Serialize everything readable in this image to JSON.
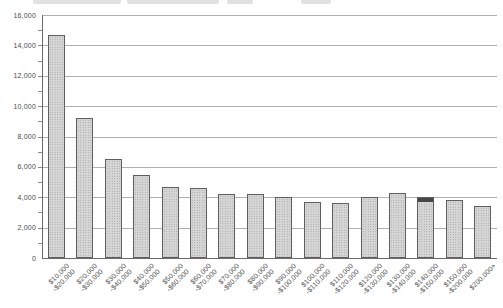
{
  "chart_data": {
    "type": "bar",
    "title": "",
    "xlabel": "",
    "ylabel": "",
    "legend": "none",
    "grid": "horizontal",
    "ylim": [
      0,
      16000
    ],
    "ytick_step": 2000,
    "y_minor_tick_step": 1000,
    "ytick_labels": [
      "16,000",
      "14,000",
      "12,000",
      "10,000",
      "8,000",
      "6,000",
      "4,000",
      "2,000",
      "0"
    ],
    "categories": [
      "$10,000-$20,000",
      "$20,000-$30,000",
      "$30,000-$40,000",
      "$40,000-$50,000",
      "$50,000-$60,000",
      "$60,000-$70,000",
      "$70,000-$80,000",
      "$80,000-$90,000",
      "$90,000-$100,000",
      "$100,000-$110,000",
      "$110,000-$120,000",
      "$120,000-$130,000",
      "$130,000-$140,000",
      "$140,000-$150,000",
      "$150,000-$200,000",
      "$200,000+"
    ],
    "category_label_lines": [
      [
        "$10,000",
        "-$20,000"
      ],
      [
        "$20,000",
        "-$30,000"
      ],
      [
        "$30,000",
        "-$40,000"
      ],
      [
        "$40,000",
        "-$50,000"
      ],
      [
        "$50,000",
        "-$60,000"
      ],
      [
        "$60,000",
        "-$70,000"
      ],
      [
        "$70,000",
        "-$80,000"
      ],
      [
        "$80,000",
        "-$90,000"
      ],
      [
        "$90,000",
        "-$100,000"
      ],
      [
        "$100,000",
        "-$110,000"
      ],
      [
        "$110,000",
        "-$120,000"
      ],
      [
        "$120,000",
        "-$130,000"
      ],
      [
        "$130,000",
        "-$140,000"
      ],
      [
        "$140,000",
        "-$150,000"
      ],
      [
        "$150,000",
        "-$200,000"
      ],
      [
        "$200,000+"
      ]
    ],
    "values": [
      14700,
      9200,
      6500,
      5500,
      4700,
      4600,
      4250,
      4250,
      4000,
      3700,
      3600,
      4050,
      4300,
      4000,
      3800,
      3450
    ],
    "highlight": {
      "category": "$140,000-$150,000",
      "style": "dark-cap-on-bar-top",
      "cap_color": "#474747"
    },
    "colors": {
      "bar_fill": "#d6d6d6",
      "bar_dot_texture": "#979797",
      "bar_border": "#5f5f5f",
      "gridline": "#b0b0b0",
      "axis": "#6b6b6b",
      "tick_label_text": "#4a4a4a",
      "background": "#ffffff"
    }
  }
}
